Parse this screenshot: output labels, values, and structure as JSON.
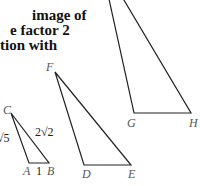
{
  "text": {
    "lines": [
      "image of",
      "e factor 2",
      "tion with"
    ]
  },
  "figure": {
    "triangle_abc": {
      "vertices": {
        "A": "A",
        "B": "B",
        "C": "C"
      },
      "side_labels": {
        "ab": "1",
        "ac": "√5",
        "bc": "2√2"
      }
    },
    "triangle_def": {
      "vertices": {
        "D": "D",
        "E": "E",
        "F": "F"
      }
    },
    "triangle_ghi": {
      "vertices": {
        "G": "G",
        "H": "H"
      }
    },
    "line_color": "#222222",
    "label_color": "#555555"
  }
}
